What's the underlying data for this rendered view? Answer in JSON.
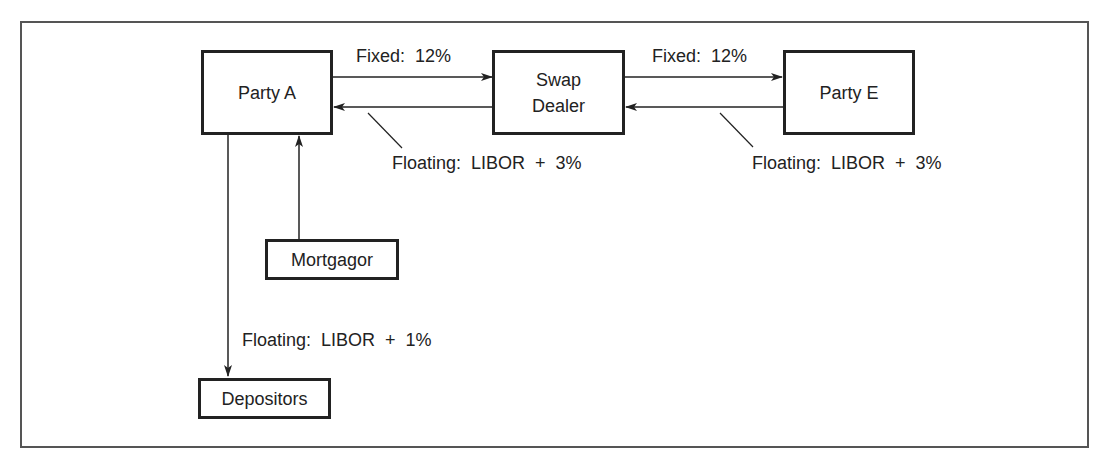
{
  "diagram": {
    "type": "interest-rate-swap-flow",
    "nodes": {
      "party_a": "Party A",
      "swap_dealer_line1": "Swap",
      "swap_dealer_line2": "Dealer",
      "party_e": "Party E",
      "mortgagor": "Mortgagor",
      "depositors": "Depositors"
    },
    "edges": {
      "a_to_dealer": "Fixed:  12%",
      "dealer_to_a": "Floating:  LIBOR  +  3%",
      "dealer_to_e": "Fixed:  12%",
      "e_to_dealer": "Floating:  LIBOR  +  3%",
      "a_to_depositors": "Floating:  LIBOR  +  1%"
    },
    "colors": {
      "line": "#222222",
      "frame": "#555555",
      "background": "#ffffff"
    }
  }
}
